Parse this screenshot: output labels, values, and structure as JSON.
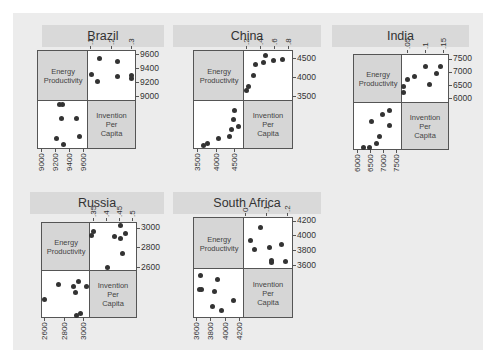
{
  "labels": {
    "var1": "Energy Productivity",
    "var2": "Invention Per Capita"
  },
  "chart_data": [
    {
      "type": "scatter",
      "title": "Brazil",
      "variables": [
        "Energy Productivity",
        "Invention Per Capita"
      ],
      "energy_ticks": [
        9000,
        9200,
        9400,
        9600
      ],
      "energy_tick_labels": [
        "9000",
        "9200",
        "9400",
        "9600"
      ],
      "invention_ticks": [
        0.1,
        0.2,
        0.3
      ],
      "invention_tick_labels": [
        ".1",
        ".2",
        ".3"
      ],
      "energy_range": [
        8950,
        9650
      ],
      "invention_range": [
        0.085,
        0.315
      ],
      "x": [
        9255,
        9300,
        9280,
        9500,
        9220,
        9310,
        9545
      ],
      "y": [
        0.3,
        0.3,
        0.23,
        0.23,
        0.13,
        0.1,
        0.14
      ],
      "xlabel": "Energy Productivity",
      "ylabel": "Invention Per Capita"
    },
    {
      "type": "scatter",
      "title": "China",
      "variables": [
        "Energy Productivity",
        "Invention Per Capita"
      ],
      "energy_ticks": [
        3500,
        4000,
        4500
      ],
      "energy_tick_labels": [
        "3500",
        "4000",
        "4500"
      ],
      "invention_ticks": [
        0.2,
        0.4,
        0.6,
        0.8
      ],
      "invention_tick_labels": [
        ".2",
        ".4",
        ".6",
        ".8"
      ],
      "energy_range": [
        3400,
        4700
      ],
      "invention_range": [
        0.15,
        0.85
      ],
      "x": [
        3640,
        3760,
        4040,
        4340,
        4400,
        4590,
        4440,
        4475
      ],
      "y": [
        0.19,
        0.21,
        0.29,
        0.32,
        0.43,
        0.47,
        0.58,
        0.71
      ],
      "xlabel": "Energy Productivity",
      "ylabel": "Invention Per Capita"
    },
    {
      "type": "scatter",
      "title": "India",
      "variables": [
        "Energy Productivity",
        "Invention Per Capita"
      ],
      "energy_ticks": [
        6000,
        6500,
        7000,
        7500
      ],
      "energy_tick_labels": [
        "6000",
        "6500",
        "7000",
        "7500"
      ],
      "invention_ticks": [
        0.05,
        0.1,
        0.15
      ],
      "invention_tick_labels": [
        ".05",
        ".1",
        ".15"
      ],
      "energy_range": [
        5850,
        7650
      ],
      "invention_range": [
        0.035,
        0.16
      ],
      "x": [
        6210,
        6450,
        6720,
        6840,
        6510,
        6925,
        7220,
        7220
      ],
      "y": [
        0.04,
        0.04,
        0.05,
        0.07,
        0.11,
        0.13,
        0.14,
        0.1
      ],
      "xlabel": "Energy Productivity",
      "ylabel": "Invention Per Capita"
    },
    {
      "type": "scatter",
      "title": "Russia",
      "variables": [
        "Energy Productivity",
        "Invention Per Capita"
      ],
      "energy_ticks": [
        2600,
        2800,
        3000
      ],
      "energy_tick_labels": [
        "2600",
        "2800",
        "3000"
      ],
      "invention_ticks": [
        0.35,
        0.4,
        0.45,
        0.5
      ],
      "invention_tick_labels": [
        ".35",
        ".4",
        ".45",
        ".5"
      ],
      "energy_range": [
        2570,
        3050
      ],
      "invention_range": [
        0.335,
        0.51
      ],
      "x": [
        2600,
        2735,
        2895,
        2910,
        2945,
        3020,
        2920,
        2960
      ],
      "y": [
        0.4,
        0.46,
        0.45,
        0.43,
        0.47,
        0.45,
        0.34,
        0.35
      ],
      "xlabel": "Energy Productivity",
      "ylabel": "Invention Per Capita"
    },
    {
      "type": "scatter",
      "title": "South Africa",
      "variables": [
        "Energy Productivity",
        "Invention Per Capita"
      ],
      "energy_ticks": [
        3600,
        3800,
        4000,
        4200
      ],
      "energy_tick_labels": [
        "3600",
        "3800",
        "4000",
        "4200"
      ],
      "invention_ticks": [
        0,
        0.1,
        0.2
      ],
      "invention_tick_labels": [
        "0",
        ".1",
        ".2"
      ],
      "energy_range": [
        3560,
        4240
      ],
      "invention_range": [
        -0.01,
        0.22
      ],
      "x": [
        3650,
        3630,
        3660,
        3885,
        3840,
        4105,
        3815,
        3940
      ],
      "y": [
        0.19,
        0.12,
        0.12,
        0.17,
        0.11,
        0.07,
        0.04,
        0.02
      ],
      "xlabel": "Energy Productivity",
      "ylabel": "Invention Per Capita"
    }
  ],
  "layout": {
    "panels": [
      {
        "title_box": [
          42,
          25,
          122,
          22
        ],
        "matrix": [
          37,
          50,
          99,
          99
        ]
      },
      {
        "title_box": [
          173,
          25,
          148,
          22
        ],
        "matrix": [
          193,
          50,
          100,
          99
        ]
      },
      {
        "title_box": [
          332,
          25,
          137,
          22
        ],
        "matrix": [
          353,
          54,
          96,
          96
        ]
      },
      {
        "title_box": [
          30,
          192,
          134,
          22
        ],
        "matrix": [
          41,
          222,
          96,
          96
        ]
      },
      {
        "title_box": [
          173,
          192,
          148,
          22
        ],
        "matrix": [
          193,
          217,
          100,
          101
        ]
      }
    ]
  }
}
